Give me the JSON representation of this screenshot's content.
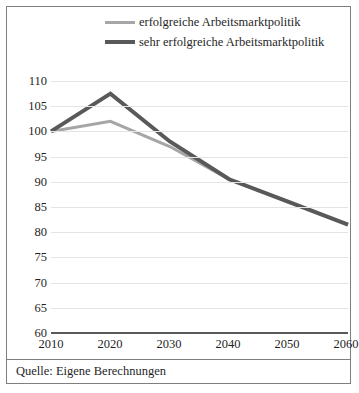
{
  "figure": {
    "caption": "Quelle: Eigene Berechnungen"
  },
  "legend": {
    "position": "top-center",
    "entries": [
      {
        "label": "erfolgreiche Arbeitsmarktpolitik",
        "color": "#a6a6a6",
        "swatch": "line-swatch-light"
      },
      {
        "label": "sehr erfolgreiche Arbeitsmarktpolitik",
        "color": "#595959",
        "swatch": "line-swatch-dark"
      }
    ]
  },
  "axes": {
    "y_ticks": [
      "110",
      "105",
      "100",
      "95",
      "90",
      "85",
      "80",
      "75",
      "70",
      "65",
      "60"
    ],
    "x_ticks": [
      "2010",
      "2020",
      "2030",
      "2040",
      "2050",
      "2060"
    ]
  },
  "chart_data": {
    "type": "line",
    "title": "",
    "subtitle": "",
    "xlabel": "",
    "ylabel": "",
    "categories": [
      "2010",
      "2020",
      "2030",
      "2040",
      "2050",
      "2060"
    ],
    "x": [
      2010,
      2020,
      2030,
      2040,
      2050,
      2060
    ],
    "series": [
      {
        "name": "erfolgreiche Arbeitsmarktpolitik",
        "color": "#a6a6a6",
        "width": 3,
        "values": [
          100,
          102,
          97,
          90.5,
          86,
          81.5
        ]
      },
      {
        "name": "sehr erfolgreiche Arbeitsmarktpolitik",
        "color": "#595959",
        "width": 4,
        "values": [
          100,
          107.5,
          98,
          90.5,
          86,
          81.5
        ]
      }
    ],
    "ylim": [
      60,
      110
    ],
    "ytick_step": 5,
    "xlim": [
      2010,
      2060
    ],
    "grid": true,
    "grid_color": "#e4e4e4",
    "baseline_color": "#595959",
    "legend_position": "top-center",
    "annotation": "Quelle: Eigene Berechnungen"
  }
}
